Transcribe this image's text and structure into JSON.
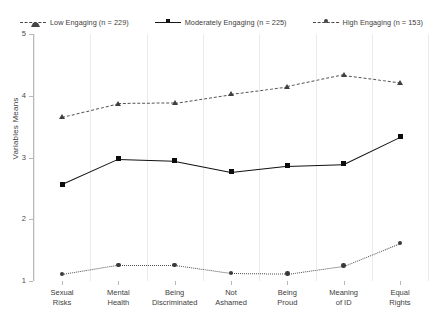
{
  "chart_data": {
    "type": "line",
    "title": "",
    "xlabel": "",
    "ylabel": "Variables Means",
    "ylim": [
      1,
      5
    ],
    "yticks": [
      1,
      2,
      3,
      4,
      5
    ],
    "grid": "vertical",
    "legend_position": "top",
    "categories": [
      "Sexual\nRisks",
      "Mental\nHealth",
      "Being\nDiscriminated",
      "Not\nAshamed",
      "Being\nProud",
      "Meaning\nof ID",
      "Equal\nRights"
    ],
    "series": [
      {
        "name": "Low Engaging (n = 229)",
        "n": 229,
        "marker": "triangle",
        "linestyle": "dashed",
        "color": "#4a4a4a",
        "values": [
          3.66,
          3.88,
          3.89,
          4.03,
          4.15,
          4.34,
          4.22
        ]
      },
      {
        "name": "Moderately Engaging (n = 225)",
        "n": 225,
        "marker": "square",
        "linestyle": "solid",
        "color": "#111111",
        "values": [
          2.57,
          2.98,
          2.95,
          2.77,
          2.87,
          2.9,
          3.34
        ]
      },
      {
        "name": "High Engaging (n = 153)",
        "n": 153,
        "marker": "circle",
        "linestyle": "dotted",
        "color": "#4f4f4f",
        "values": [
          1.11,
          1.26,
          1.26,
          1.13,
          1.12,
          1.25,
          1.62
        ]
      }
    ]
  },
  "legend": {
    "items": [
      {
        "label": "Low Engaging (n = 229)"
      },
      {
        "label": "Moderately Engaging (n = 225)"
      },
      {
        "label": "High Engaging (n = 153)"
      }
    ]
  },
  "yaxis": {
    "title": "Variables Means",
    "ticks": [
      "5",
      "4",
      "3",
      "2",
      "1"
    ]
  },
  "xaxis": {
    "ticks": [
      {
        "line1": "Sexual",
        "line2": "Risks"
      },
      {
        "line1": "Mental",
        "line2": "Health"
      },
      {
        "line1": "Being",
        "line2": "Discriminated"
      },
      {
        "line1": "Not",
        "line2": "Ashamed"
      },
      {
        "line1": "Being",
        "line2": "Proud"
      },
      {
        "line1": "Meaning",
        "line2": "of ID"
      },
      {
        "line1": "Equal",
        "line2": "Rights"
      }
    ]
  }
}
